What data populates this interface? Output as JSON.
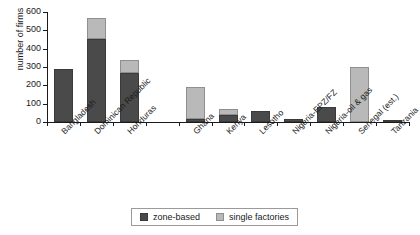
{
  "chart_data": {
    "type": "bar",
    "stacked": true,
    "title": "",
    "xlabel": "",
    "ylabel": "number of firms",
    "ylim": [
      0,
      600
    ],
    "yticks": [
      0,
      100,
      200,
      300,
      400,
      500,
      600
    ],
    "grid": false,
    "legend_position": "bottom",
    "categories": [
      "Bangladesh",
      "Dominican Republic",
      "Honduras",
      "",
      "Ghana",
      "Kenya",
      "Lesotho",
      "Nigeria-EPZ/FZ",
      "Nigeria-oil & gas",
      "Senegal (est.)",
      "Tanzania"
    ],
    "series": [
      {
        "name": "zone-based",
        "color": "#4a4a4a",
        "values": [
          288,
          455,
          265,
          0,
          14,
          36,
          62,
          18,
          82,
          0,
          12
        ]
      },
      {
        "name": "single factories",
        "color": "#b9b9b9",
        "values": [
          0,
          110,
          75,
          0,
          176,
          34,
          0,
          0,
          0,
          300,
          0
        ]
      }
    ],
    "totals": [
      288,
      565,
      340,
      0,
      190,
      70,
      62,
      18,
      82,
      300,
      12
    ]
  },
  "legend": {
    "items": [
      {
        "label": "zone-based",
        "swatch": "zone"
      },
      {
        "label": "single factories",
        "swatch": "single"
      }
    ]
  },
  "axis": {
    "y_title": "number of firms"
  }
}
